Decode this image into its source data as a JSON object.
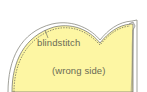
{
  "diagram": {
    "labels": {
      "blindstitch": "blindstitch",
      "wrong_side": "(wrong side)"
    },
    "colors": {
      "fabric_fill": "#fdf6a3",
      "outline": "#7a7a72",
      "stitch": "#5f5f58",
      "background": "#ffffff"
    },
    "elements": [
      {
        "name": "fabric-piece",
        "shape": "scalloped edge, large left curve, center notch, small right curve"
      },
      {
        "name": "folded-edge",
        "shape": "vertical fold along right side"
      },
      {
        "name": "blindstitch-line",
        "shape": "dashed line following curved edge"
      },
      {
        "name": "leader-line",
        "target": "blindstitch-line"
      }
    ]
  }
}
